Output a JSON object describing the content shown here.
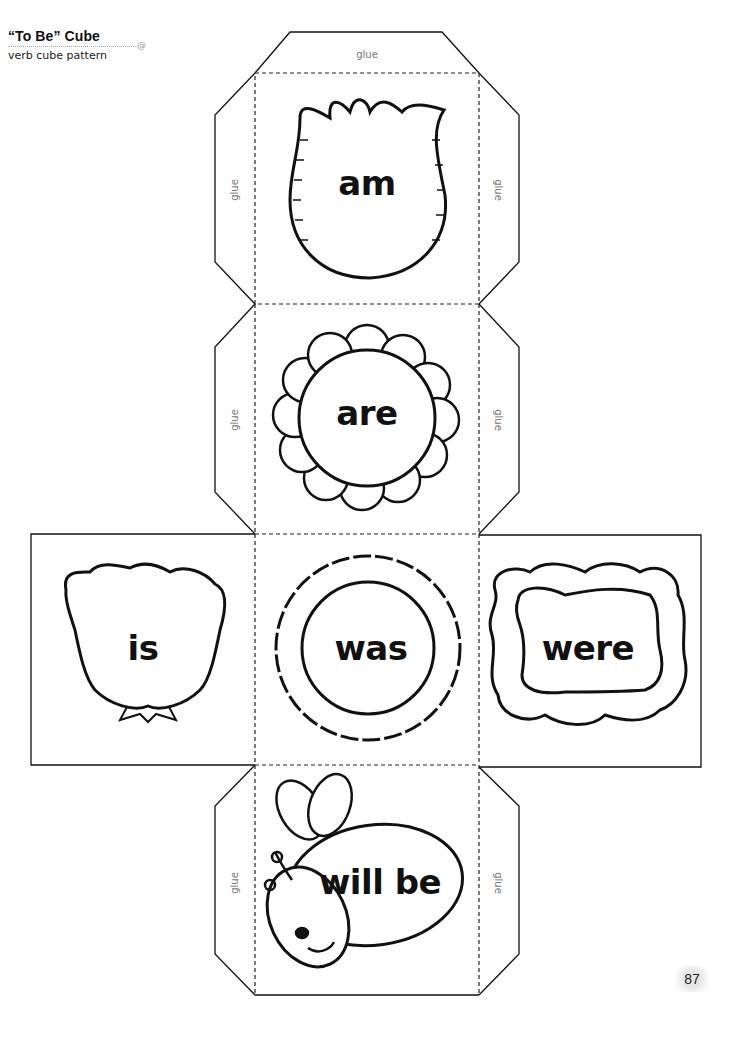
{
  "header": {
    "title": "“To Be” Cube",
    "subtitle": "verb cube pattern"
  },
  "flaps": {
    "top": "glue",
    "am_left": "glue",
    "am_right": "glue",
    "are_left": "glue",
    "are_right": "glue",
    "willbe_left": "glue",
    "willbe_right": "glue"
  },
  "faces": [
    {
      "id": "face-am",
      "word": "am",
      "illustration": "tulip-flower"
    },
    {
      "id": "face-are",
      "word": "are",
      "illustration": "daisy-flower"
    },
    {
      "id": "face-is",
      "word": "is",
      "illustration": "ruffled-flower-bud"
    },
    {
      "id": "face-was",
      "word": "was",
      "illustration": "scalloped-circle-flower"
    },
    {
      "id": "face-were",
      "word": "were",
      "illustration": "ruffled-frame"
    },
    {
      "id": "face-willbe",
      "word": "will be",
      "illustration": "bee"
    }
  ],
  "page_number": "87",
  "colors": {
    "line": "#111111",
    "glue_text": "#777777"
  }
}
